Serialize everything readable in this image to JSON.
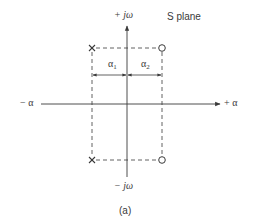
{
  "diagram": {
    "plane_label": "S plane",
    "axes": {
      "pos_imag": "+ jω",
      "neg_imag": "− jω",
      "neg_real": "− α",
      "pos_real": "+ α"
    },
    "dimensions": {
      "alpha1": {
        "symbol": "α",
        "subscript": "1"
      },
      "alpha2": {
        "symbol": "α",
        "subscript": "2"
      }
    },
    "poles": {
      "marker": "X",
      "count": 2
    },
    "zeros": {
      "marker": "O",
      "count": 2
    },
    "caption": "(a)",
    "colors": {
      "line": "#3a3a3a",
      "background": "#ffffff"
    }
  }
}
